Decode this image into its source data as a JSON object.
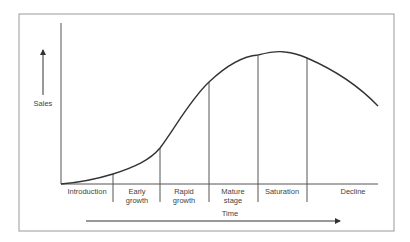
{
  "diagram": {
    "y_axis_label": "Sales",
    "x_axis_label": "Time",
    "stages": [
      {
        "line1": "Introduction",
        "line2": ""
      },
      {
        "line1": "Early",
        "line2": "growth"
      },
      {
        "line1": "Rapid",
        "line2": "growth"
      },
      {
        "line1": "Mature",
        "line2": "stage"
      },
      {
        "line1": "Saturation",
        "line2": ""
      },
      {
        "line1": "Decline",
        "line2": ""
      }
    ],
    "colors": {
      "frame": "#999999",
      "axis": "#555555",
      "curve": "#333333",
      "text": "#444444"
    }
  }
}
